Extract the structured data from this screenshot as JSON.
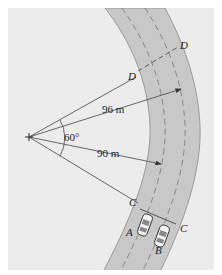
{
  "diagram": {
    "type": "curved-road-kinematics",
    "background_color": "#ececec",
    "road_color": "#c8c8c8",
    "line_color": "#333333",
    "center_marker": "+",
    "labels": {
      "D_inner": "D",
      "D_outer": "D",
      "C_inner": "C",
      "C_outer": "C",
      "car_A": "A",
      "car_B": "B",
      "radius_outer": "96 m",
      "radius_inner": "90 m",
      "angle": "60°"
    },
    "cars": [
      {
        "id": "A",
        "lane": "inner"
      },
      {
        "id": "B",
        "lane": "outer"
      }
    ]
  }
}
